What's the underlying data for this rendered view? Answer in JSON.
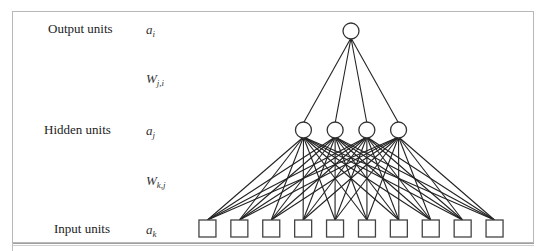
{
  "layers": [
    {
      "name": "Output units",
      "symbol": "a",
      "sub": "i",
      "count": 1
    },
    {
      "name": "Hidden units",
      "symbol": "a",
      "sub": "j",
      "count": 4
    },
    {
      "name": "Input units",
      "symbol": "a",
      "sub": "k",
      "count": 10
    }
  ],
  "weights": [
    {
      "symbol": "W",
      "sub": "j,i",
      "between": [
        "Hidden units",
        "Output units"
      ]
    },
    {
      "symbol": "W",
      "sub": "k,j",
      "between": [
        "Input units",
        "Hidden units"
      ]
    }
  ],
  "node_shapes": {
    "output": "circle",
    "hidden": "circle",
    "input": "square"
  },
  "connectivity": "fully-connected"
}
